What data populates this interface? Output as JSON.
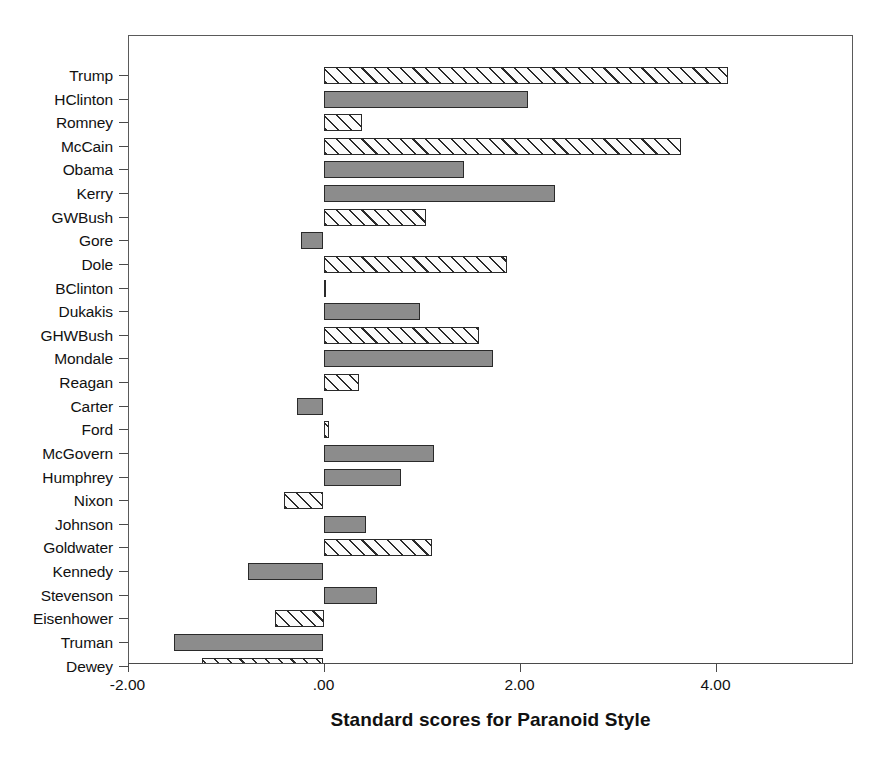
{
  "chart_data": {
    "type": "bar",
    "orientation": "horizontal",
    "title": "",
    "xlabel": "Standard scores for Paranoid Style",
    "ylabel": "",
    "xlim": [
      -2.45,
      5.0
    ],
    "ylim": [
      0,
      26
    ],
    "grid": false,
    "legend": false,
    "xticks": [
      -2.0,
      0.0,
      2.0,
      4.0
    ],
    "xticklabels": [
      "-2.00",
      ".00",
      "2.00",
      "4.00"
    ],
    "categories": [
      "Trump",
      "HClinton",
      "Romney",
      "McCain",
      "Obama",
      "Kerry",
      "GWBush",
      "Gore",
      "Dole",
      "BClinton",
      "Dukakis",
      "GHWBush",
      "Mondale",
      "Reagan",
      "Carter",
      "Ford",
      "McGovern",
      "Humphrey",
      "Nixon",
      "Johnson",
      "Goldwater",
      "Kennedy",
      "Stevenson",
      "Eisenhower",
      "Truman",
      "Dewey"
    ],
    "values": [
      4.13,
      2.09,
      0.39,
      3.65,
      1.43,
      2.36,
      1.05,
      -0.23,
      1.87,
      0.01,
      0.98,
      1.59,
      1.73,
      0.36,
      -0.27,
      0.06,
      1.13,
      0.79,
      -0.4,
      0.43,
      1.11,
      -0.77,
      0.55,
      -0.5,
      -1.53,
      -1.24
    ],
    "fills": [
      "hatch",
      "solid",
      "hatch",
      "hatch",
      "solid",
      "solid",
      "hatch",
      "solid",
      "hatch",
      "hatch",
      "solid",
      "hatch",
      "solid",
      "hatch",
      "solid",
      "hatch",
      "solid",
      "solid",
      "hatch",
      "solid",
      "hatch",
      "solid",
      "solid",
      "hatch",
      "solid",
      "hatch"
    ],
    "colors": {
      "solid_fill": "#8c8c8c",
      "hatch_fill": "#fbfbfb",
      "bar_edge": "#2a2a2a",
      "axis": "#4a4a4a",
      "frame": "#5a5a5a",
      "text": "#111111",
      "background": "#ffffff"
    }
  }
}
